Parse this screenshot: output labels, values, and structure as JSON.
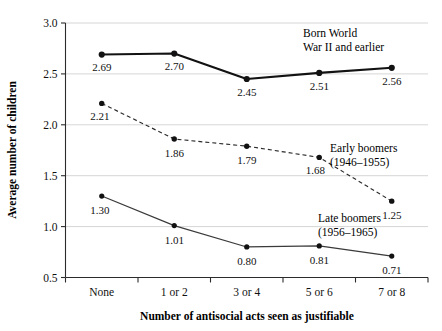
{
  "chart_data": {
    "type": "line",
    "title": "",
    "xlabel": "Number of antisocial acts seen as justifiable",
    "ylabel": "Average number of children",
    "categories": [
      "None",
      "1 or 2",
      "3 or 4",
      "5 or 6",
      "7 or 8"
    ],
    "ylim": [
      0.5,
      3.0
    ],
    "yticks": [
      "0.5",
      "1.0",
      "1.5",
      "2.0",
      "2.5",
      "3.0"
    ],
    "ytick_values": [
      0.5,
      1.0,
      1.5,
      2.0,
      2.5,
      3.0
    ],
    "grid": "horizontal",
    "legend_position": "inline-annotations",
    "series": [
      {
        "name": "Born World War II and earlier",
        "annotation_line1": "Born World",
        "annotation_line2": "War II and earlier",
        "style": "solid-thick",
        "values": [
          2.69,
          2.7,
          2.45,
          2.51,
          2.56
        ],
        "labels": [
          "2.69",
          "2.70",
          "2.45",
          "2.51",
          "2.56"
        ]
      },
      {
        "name": "Early boomers (1946–1955)",
        "annotation_line1": "Early boomers",
        "annotation_line2": "(1946–1955)",
        "style": "dashed",
        "values": [
          2.21,
          1.86,
          1.79,
          1.68,
          1.25
        ],
        "labels": [
          "2.21",
          "1.86",
          "1.79",
          "1.68",
          "1.25"
        ]
      },
      {
        "name": "Late boomers (1956–1965)",
        "annotation_line1": "Late boomers",
        "annotation_line2": "(1956–1965)",
        "style": "solid-thin",
        "values": [
          1.3,
          1.01,
          0.8,
          0.81,
          0.71
        ],
        "labels": [
          "1.30",
          "1.01",
          "0.80",
          "0.81",
          "0.71"
        ]
      }
    ],
    "colors": {
      "line": "#121212",
      "grid": "#d6d6d6",
      "axis": "#2b2b2b",
      "text": "#111111",
      "background": "#ffffff"
    }
  }
}
